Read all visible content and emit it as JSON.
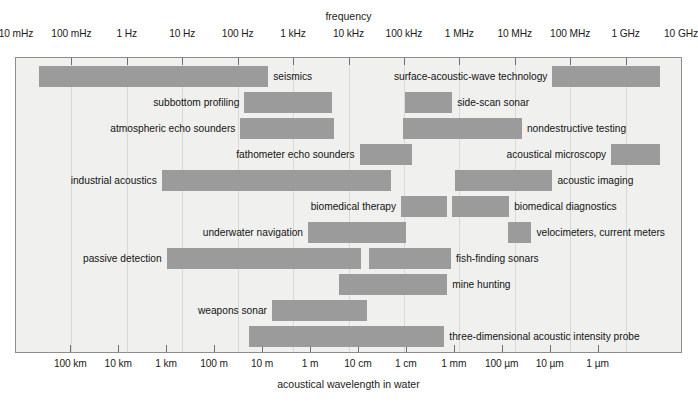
{
  "chart_data": {
    "type": "bar",
    "title": "",
    "xlabel": "frequency",
    "xlabel_secondary": "acoustical wavelength in water",
    "ylabel": "",
    "orientation": "horizontal",
    "xscale": "log",
    "grid": true,
    "legend": "none",
    "bar_color": "#9b9b9b",
    "plot_background": "#f0f0ee",
    "frequency_ticks": [
      "10 mHz",
      "100 mHz",
      "1 Hz",
      "10 Hz",
      "100 Hz",
      "1 kHz",
      "10 kHz",
      "100 kHz",
      "1 MHz",
      "10 MHz",
      "100 MHz",
      "1 GHz",
      "10 GHz"
    ],
    "frequency_decade_values": [
      0.01,
      0.1,
      1,
      10,
      100,
      1000,
      10000,
      100000,
      1000000,
      10000000,
      100000000,
      1000000000,
      10000000000
    ],
    "wavelength_ticks": [
      "100 km",
      "10 km",
      "1 km",
      "100 m",
      "10 m",
      "1 m",
      "10 cm",
      "1 cm",
      "1 mm",
      "100 µm",
      "10 µm",
      "1 µm"
    ],
    "xlim_decades": [
      -2,
      10
    ],
    "bars": [
      {
        "label": "seismics",
        "label_side": "right",
        "start_decade": -1.58,
        "end_decade": 2.55
      },
      {
        "label": "surface-acoustic-wave technology",
        "label_side": "left",
        "start_decade": 7.68,
        "end_decade": 9.62
      },
      {
        "label": "subbottom profiling",
        "label_side": "left",
        "start_decade": 2.12,
        "end_decade": 3.7
      },
      {
        "label": "side-scan sonar",
        "label_side": "right",
        "start_decade": 5.02,
        "end_decade": 5.87
      },
      {
        "label": "atmospheric echo sounders",
        "label_side": "left",
        "start_decade": 2.05,
        "end_decade": 3.73
      },
      {
        "label": "nondestructive testing",
        "label_side": "right",
        "start_decade": 4.99,
        "end_decade": 7.13
      },
      {
        "label": "fathometer echo sounders",
        "label_side": "left",
        "start_decade": 4.2,
        "end_decade": 5.15
      },
      {
        "label": "acoustical microscopy",
        "label_side": "left",
        "start_decade": 8.74,
        "end_decade": 9.62
      },
      {
        "label": "industrial acoustics",
        "label_side": "left",
        "start_decade": 0.63,
        "end_decade": 4.77
      },
      {
        "label": "acoustic imaging",
        "label_side": "right",
        "start_decade": 5.92,
        "end_decade": 7.68
      },
      {
        "label": "biomedical therapy",
        "label_side": "left",
        "start_decade": 4.95,
        "end_decade": 5.78
      },
      {
        "label": "biomedical diagnostics",
        "label_side": "right",
        "start_decade": 5.87,
        "end_decade": 6.9
      },
      {
        "label": "underwater navigation",
        "label_side": "left",
        "start_decade": 3.27,
        "end_decade": 5.03
      },
      {
        "label": "velocimeters, current meters",
        "label_side": "right",
        "start_decade": 6.87,
        "end_decade": 7.3
      },
      {
        "label": "passive detection",
        "label_side": "left",
        "start_decade": 0.72,
        "end_decade": 4.23
      },
      {
        "label": "fish-finding sonars",
        "label_side": "right",
        "start_decade": 4.37,
        "end_decade": 5.85
      },
      {
        "label": "mine hunting",
        "label_side": "right",
        "start_decade": 3.82,
        "end_decade": 5.78
      },
      {
        "label": "weapons sonar",
        "label_side": "left",
        "start_decade": 2.62,
        "end_decade": 4.33
      },
      {
        "label": "three-dimensional acoustic intensity probe",
        "label_side": "right",
        "start_decade": 2.2,
        "end_decade": 5.73
      }
    ],
    "rows": [
      {
        "index": 0,
        "bars": [
          0,
          1
        ]
      },
      {
        "index": 1,
        "bars": [
          2,
          3
        ]
      },
      {
        "index": 2,
        "bars": [
          4,
          5
        ]
      },
      {
        "index": 3,
        "bars": [
          6,
          7
        ]
      },
      {
        "index": 4,
        "bars": [
          8,
          9
        ]
      },
      {
        "index": 5,
        "bars": [
          10,
          11
        ]
      },
      {
        "index": 6,
        "bars": [
          12,
          13
        ]
      },
      {
        "index": 7,
        "bars": [
          14,
          15
        ]
      },
      {
        "index": 8,
        "bars": [
          16
        ]
      },
      {
        "index": 9,
        "bars": [
          17
        ]
      },
      {
        "index": 10,
        "bars": [
          18
        ]
      }
    ]
  }
}
